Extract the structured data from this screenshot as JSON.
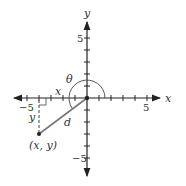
{
  "diagram": {
    "axes": {
      "x_label": "x",
      "y_label": "y",
      "x_range": [
        -5,
        5
      ],
      "y_range": [
        -5,
        5
      ]
    },
    "tick_labels": {
      "x_neg": "−5",
      "x_pos": "5",
      "y_pos": "5",
      "y_neg": "−5"
    },
    "point": {
      "label": "(x, y)",
      "x": -4,
      "y": -3
    },
    "segment_labels": {
      "horizontal": "x",
      "vertical": "y",
      "distance": "d"
    },
    "angle_label": "θ",
    "colors": {
      "axis": "#222222",
      "segment": "#666666",
      "point": "#222222"
    }
  }
}
